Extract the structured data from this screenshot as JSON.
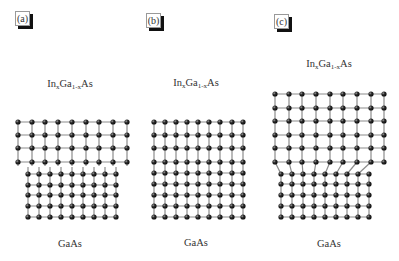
{
  "figure": {
    "panels": [
      {
        "id": "a",
        "label": "(a)",
        "label_box": {
          "x": 15,
          "y": 11
        },
        "top_layer": {
          "name": "InxGa1-xAs",
          "base": "In",
          "sub1": "x",
          "mid": "Ga",
          "sub2": "1-x",
          "end": "As",
          "cx": 70,
          "y": 78
        },
        "bottom_layer": {
          "name": "GaAs",
          "cx": 70,
          "y": 238
        },
        "description": "Separated: relaxed InGaAs lattice (larger constant) above GaAs substrate lattice",
        "upper_lattice": {
          "cols": [
            18,
            32,
            45,
            58,
            72,
            86,
            99,
            113,
            127
          ],
          "rows": [
            122,
            135,
            148,
            162
          ],
          "bond_down_stub": false
        },
        "lower_lattice": {
          "cols": [
            28,
            39,
            50,
            61,
            72,
            83,
            94,
            105,
            116
          ],
          "rows": [
            174,
            185,
            195,
            206,
            217
          ],
          "stub_top": 167
        }
      },
      {
        "id": "b",
        "label": "(b)",
        "label_box": {
          "x": 146,
          "y": 13
        },
        "top_layer": {
          "name": "InxGa1-xAs",
          "base": "In",
          "sub1": "x",
          "mid": "Ga",
          "sub2": "1-x",
          "end": "As",
          "cx": 196,
          "y": 77
        },
        "bottom_layer": {
          "name": "GaAs",
          "cx": 196,
          "y": 237
        },
        "description": "Coherently strained (pseudomorphic) InGaAs on GaAs",
        "upper_lattice": {
          "cols": [
            154,
            165,
            176,
            187,
            198,
            209,
            220,
            232,
            243
          ],
          "rows": [
            122,
            135,
            148,
            162
          ]
        },
        "lower_lattice": {
          "cols": [
            154,
            165,
            176,
            187,
            198,
            209,
            220,
            232,
            243
          ],
          "rows": [
            173,
            184,
            195,
            206,
            217
          ]
        }
      },
      {
        "id": "c",
        "label": "(c)",
        "label_box": {
          "x": 274,
          "y": 14
        },
        "top_layer": {
          "name": "InxGa1-xAs",
          "base": "In",
          "sub1": "x",
          "mid": "Ga",
          "sub2": "1-x",
          "end": "As",
          "cx": 329,
          "y": 58
        },
        "bottom_layer": {
          "name": "GaAs",
          "cx": 329,
          "y": 238
        },
        "description": "Relaxed InGaAs with misfit dislocation at interface",
        "upper_lattice": {
          "cols": [
            275,
            289,
            302,
            316,
            330,
            343,
            357,
            371,
            384
          ],
          "rows": [
            94,
            108,
            121,
            135,
            148,
            162
          ]
        },
        "lower_lattice": {
          "cols": [
            281,
            292,
            303,
            314,
            325,
            336,
            347,
            358,
            369
          ],
          "rows": [
            174,
            184,
            195,
            206,
            217
          ]
        }
      }
    ],
    "colors": {
      "atom": "#1a1a1a",
      "atom_highlight": "#9a9a9a",
      "bond": "#8c8c8c",
      "text": "#333333",
      "label_shadow": "#111111",
      "label_border": "#999999"
    }
  }
}
